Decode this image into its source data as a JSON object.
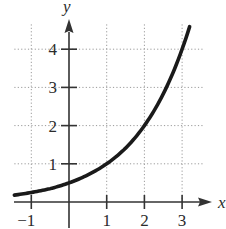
{
  "chart_data": {
    "type": "line",
    "title": "",
    "xlabel": "x",
    "ylabel": "y",
    "xlim": [
      -1.45,
      3.6
    ],
    "ylim": [
      0,
      4.9
    ],
    "grid": true,
    "grid_style": "dotted",
    "x_ticks": [
      -1,
      1,
      2,
      3
    ],
    "x_tick_labels": [
      "−1",
      "1",
      "2",
      "3"
    ],
    "y_ticks": [
      1,
      2,
      3,
      4
    ],
    "y_tick_labels": [
      "1",
      "2",
      "3",
      "4"
    ],
    "series": [
      {
        "name": "f(x) = 0.5·2^x",
        "x": [
          -1.45,
          -1,
          -0.5,
          0,
          0.5,
          1,
          1.5,
          2,
          2.5,
          3,
          3.2
        ],
        "values": [
          0.18,
          0.25,
          0.35,
          0.5,
          0.71,
          1.0,
          1.41,
          2.0,
          2.83,
          4.0,
          4.59
        ]
      }
    ],
    "legend": null,
    "colors": {
      "curve": "#1a1a1a",
      "axis": "#333333",
      "grid": "#9a9a9a",
      "text": "#2b2b2b"
    }
  }
}
